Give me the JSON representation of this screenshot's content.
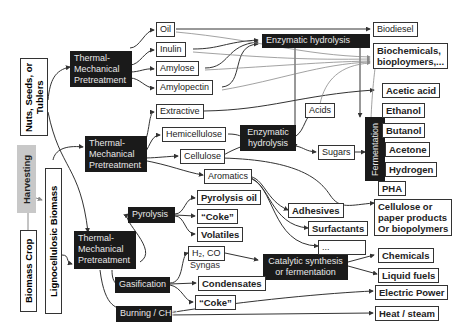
{
  "sources": {
    "biomass_crop": "Biomass Crop",
    "harvesting": "Harvesting",
    "nuts_seeds": "Nuts, Seeds, or Tublers",
    "lignocellulosic": "Lignocellulosic Biomass"
  },
  "pretreatment": {
    "top": [
      "Thermal-",
      "Mechanical",
      "Pretreatment"
    ],
    "middle": [
      "Thermal-",
      "Mechanical",
      "Pretreatment"
    ],
    "bottom": [
      "Thermal-",
      "Mechanical",
      "Pretreatment"
    ]
  },
  "components": {
    "oil": "Oil",
    "inulin": "Inulin",
    "amylose": "Amylose",
    "amylopectin": "Amylopectin",
    "extractive": "Extractive",
    "hemicellulose": "Hemicellulose",
    "cellulose": "Cellulose",
    "aromatics": "Aromatics",
    "acids": "Acids",
    "sugars": "Sugars"
  },
  "processes": {
    "enzymatic_hydrolysis_top": "Enzymatic hydrolysis",
    "enzymatic_hydrolysis_mid": [
      "Enzymatic",
      "hydrolysis"
    ],
    "fermentation": "Fermentation",
    "pyrolysis": "Pyrolysis",
    "gasification": "Gasification",
    "burning": "Burning / CHP",
    "catalytic": [
      "Catalytic synthesis",
      "or  fermentation"
    ]
  },
  "intermediates": {
    "pyrolysis_oil": "Pyrolysis oil",
    "coke_pyro": "“Coke”",
    "volatiles": "Volatiles",
    "syngas_formula": "H₂, CO",
    "syngas_label": "Syngas",
    "condensates": "Condensates",
    "coke_gas": "“Coke”"
  },
  "products": {
    "biodiesel": "Biodiesel",
    "biochemicals": [
      "Biochemicals,",
      "bioploymers,..."
    ],
    "acetic_acid": "Acetic acid",
    "ethanol": "Ethanol",
    "butanol": "Butanol",
    "acetone": "Acetone",
    "hydrogen": "Hydrogen",
    "pha": "PHA",
    "adhesives": "Adhesives",
    "surfactants": "Surfactants",
    "ellipsis": "...",
    "cellulose_products": [
      "Cellulose or",
      "paper products",
      "Or biopolymers"
    ],
    "chemicals": "Chemicals",
    "liquid_fuels": "Liquid fuels",
    "electric_power": "Electric Power",
    "heat_steam": "Heat / steam"
  },
  "colors": {
    "dark_box": "#1a1a1a",
    "harvest_bg": "#c8c8c8",
    "dark_wire": "#333333",
    "light_wire": "#8a8a8a"
  }
}
